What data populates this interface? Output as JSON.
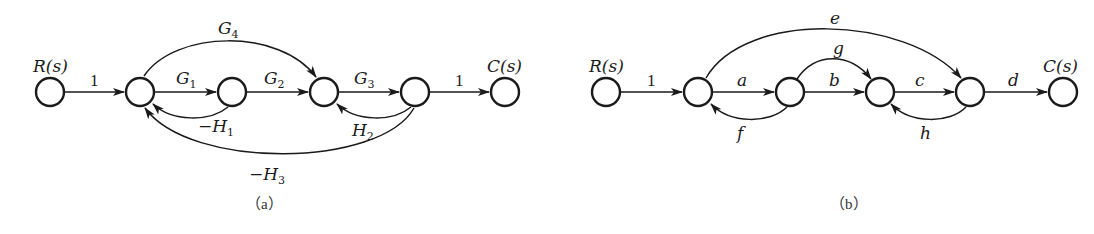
{
  "figure": {
    "colors": {
      "stroke": "#1a1a1a",
      "background": "#ffffff",
      "caption": "#333333"
    },
    "diagram_a": {
      "caption": "（a）",
      "input_label": "R(s)",
      "output_label": "C(s)",
      "nodes": [
        {
          "id": "R",
          "label": "R(s)"
        },
        {
          "id": "n1",
          "label": ""
        },
        {
          "id": "n2",
          "label": ""
        },
        {
          "id": "n3",
          "label": ""
        },
        {
          "id": "n4",
          "label": ""
        },
        {
          "id": "C",
          "label": "C(s)"
        }
      ],
      "edges": [
        {
          "from": "R",
          "to": "n1",
          "gain": "1"
        },
        {
          "from": "n1",
          "to": "n2",
          "gain": "G1"
        },
        {
          "from": "n2",
          "to": "n3",
          "gain": "G2"
        },
        {
          "from": "n3",
          "to": "n4",
          "gain": "G3"
        },
        {
          "from": "n4",
          "to": "C",
          "gain": "1"
        },
        {
          "from": "n1",
          "to": "n3",
          "gain": "G4"
        },
        {
          "from": "n2",
          "to": "n1",
          "gain": "-H1"
        },
        {
          "from": "n4",
          "to": "n3",
          "gain": "H2"
        },
        {
          "from": "n4",
          "to": "n1",
          "gain": "-H3"
        }
      ],
      "labels": {
        "in_gain": "1",
        "out_gain": "1",
        "G": "G",
        "H": "H",
        "minus": "−",
        "sub1": "1",
        "sub2": "2",
        "sub3": "3",
        "sub4": "4"
      }
    },
    "diagram_b": {
      "caption": "（b）",
      "input_label": "R(s)",
      "output_label": "C(s)",
      "nodes": [
        {
          "id": "R",
          "label": "R(s)"
        },
        {
          "id": "n1",
          "label": ""
        },
        {
          "id": "n2",
          "label": ""
        },
        {
          "id": "n3",
          "label": ""
        },
        {
          "id": "n4",
          "label": ""
        },
        {
          "id": "C",
          "label": "C(s)"
        }
      ],
      "edges": [
        {
          "from": "R",
          "to": "n1",
          "gain": "1"
        },
        {
          "from": "n1",
          "to": "n2",
          "gain": "a"
        },
        {
          "from": "n2",
          "to": "n3",
          "gain": "b"
        },
        {
          "from": "n3",
          "to": "n4",
          "gain": "c"
        },
        {
          "from": "n4",
          "to": "C",
          "gain": "d"
        },
        {
          "from": "n1",
          "to": "n4",
          "gain": "e"
        },
        {
          "from": "n2",
          "to": "n1",
          "gain": "f"
        },
        {
          "from": "n2",
          "to": "n3",
          "gain": "g"
        },
        {
          "from": "n4",
          "to": "n3",
          "gain": "h"
        }
      ],
      "labels": {
        "in_gain": "1",
        "a": "a",
        "b": "b",
        "c": "c",
        "d": "d",
        "e": "e",
        "f": "f",
        "g": "g",
        "h": "h"
      }
    }
  }
}
